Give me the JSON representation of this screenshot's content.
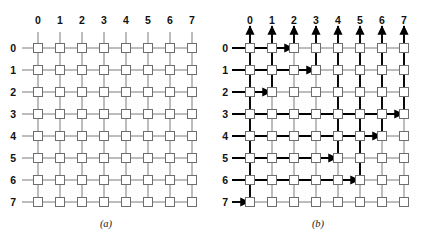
{
  "figure": {
    "width": 424,
    "height": 243,
    "background": "#ffffff"
  },
  "grid": {
    "rows": 8,
    "cols": 8,
    "row_labels": [
      "0",
      "1",
      "2",
      "3",
      "4",
      "5",
      "6",
      "7"
    ],
    "col_labels": [
      "0",
      "1",
      "2",
      "3",
      "4",
      "5",
      "6",
      "7"
    ],
    "node_size": 9,
    "spacing": 22,
    "origin_x": 38,
    "origin_y": 48,
    "line_color": "#7a7a7a",
    "node_stroke": "#6e6e6e",
    "node_fill": "#ffffff"
  },
  "panels": [
    {
      "id": "a",
      "caption": "(a)",
      "has_routes": false
    },
    {
      "id": "b",
      "caption": "(b)",
      "has_routes": true,
      "route_color": "#000000",
      "routes": [
        {
          "row": 0,
          "col": 2
        },
        {
          "row": 1,
          "col": 3
        },
        {
          "row": 2,
          "col": 1
        },
        {
          "row": 3,
          "col": 7
        },
        {
          "row": 4,
          "col": 6
        },
        {
          "row": 5,
          "col": 4
        },
        {
          "row": 6,
          "col": 5
        },
        {
          "row": 7,
          "col": 0
        }
      ]
    }
  ]
}
